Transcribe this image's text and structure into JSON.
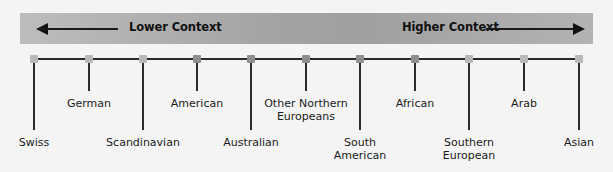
{
  "scale": {
    "left_label": "Lower Context",
    "right_label": "Higher Context",
    "left_arrow_icon": "arrow-left-icon",
    "right_arrow_icon": "arrow-right-icon"
  },
  "cultures": [
    {
      "label": "Swiss",
      "x": 34,
      "level": "long",
      "shade": "light"
    },
    {
      "label": "German",
      "x": 89,
      "level": "short",
      "shade": "light"
    },
    {
      "label": "Scandinavian",
      "x": 143,
      "level": "long",
      "shade": "light"
    },
    {
      "label": "American",
      "x": 197,
      "level": "short",
      "shade": "dark"
    },
    {
      "label": "Australian",
      "x": 251,
      "level": "long",
      "shade": "dark"
    },
    {
      "label": "Other Northern\nEuropeans",
      "x": 306,
      "level": "short",
      "shade": "dark"
    },
    {
      "label": "South\nAmerican",
      "x": 360,
      "level": "long",
      "shade": "dark"
    },
    {
      "label": "African",
      "x": 415,
      "level": "short",
      "shade": "dark"
    },
    {
      "label": "Southern\nEuropean",
      "x": 469,
      "level": "long",
      "shade": "light"
    },
    {
      "label": "Arab",
      "x": 524,
      "level": "short",
      "shade": "light"
    },
    {
      "label": "Asian",
      "x": 579,
      "level": "long",
      "shade": "light"
    }
  ],
  "colors": {
    "bar": "#a8a8a8",
    "line": "#2a2a2a",
    "background": "#f4f4f4"
  }
}
